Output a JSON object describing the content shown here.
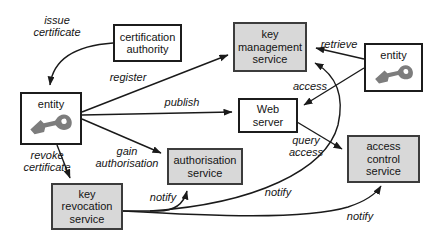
{
  "diagram": {
    "colors": {
      "box_gray": "#d8d8d8",
      "box_white": "#ffffff",
      "box_border": "#3c3c3c",
      "line": "#1a1a1a",
      "key_icon_gray": "#7d7d7d"
    },
    "nodes": [
      {
        "id": "certification-authority",
        "label": "certification\nauthority",
        "fill": "white"
      },
      {
        "id": "key-management-service",
        "label": "key\nmanagement\nservice",
        "fill": "gray"
      },
      {
        "id": "entity-top-right",
        "label": "entity",
        "fill": "white",
        "icon": "key-icon"
      },
      {
        "id": "entity-left",
        "label": "entity",
        "fill": "white",
        "icon": "key-icon"
      },
      {
        "id": "web-server",
        "label": "Web\nserver",
        "fill": "white"
      },
      {
        "id": "authorisation-service",
        "label": "authorisation\nservice",
        "fill": "gray"
      },
      {
        "id": "access-control-service",
        "label": "access\ncontrol\nservice",
        "fill": "gray"
      },
      {
        "id": "key-revocation-service",
        "label": "key\nrevocation\nservice",
        "fill": "gray"
      }
    ],
    "edge_labels": [
      {
        "id": "issue-certificate",
        "text": "issue\ncertificate"
      },
      {
        "id": "register",
        "text": "register"
      },
      {
        "id": "retrieve",
        "text": "retrieve"
      },
      {
        "id": "publish",
        "text": "publish"
      },
      {
        "id": "access",
        "text": "access"
      },
      {
        "id": "gain-authorisation",
        "text": "gain\nauthorisation"
      },
      {
        "id": "query-access",
        "text": "query\naccess"
      },
      {
        "id": "revoke-certificate",
        "text": "revoke\ncertificate"
      },
      {
        "id": "notify-authorisation",
        "text": "notify"
      },
      {
        "id": "notify-key-management",
        "text": "notify"
      },
      {
        "id": "notify-access-control",
        "text": "notify"
      }
    ],
    "edges": [
      {
        "from": "certification-authority",
        "to": "entity-left",
        "label": "issue certificate"
      },
      {
        "from": "entity-left",
        "to": "key-management-service",
        "label": "register"
      },
      {
        "from": "entity-left",
        "to": "web-server",
        "label": "publish"
      },
      {
        "from": "entity-left",
        "to": "authorisation-service",
        "label": "gain authorisation"
      },
      {
        "from": "entity-left",
        "to": "key-revocation-service",
        "label": "revoke certificate"
      },
      {
        "from": "entity-top-right",
        "to": "key-management-service",
        "label": "retrieve"
      },
      {
        "from": "entity-top-right",
        "to": "web-server",
        "label": "access"
      },
      {
        "from": "web-server",
        "to": "access-control-service",
        "label": "query access"
      },
      {
        "from": "key-revocation-service",
        "to": "authorisation-service",
        "label": "notify"
      },
      {
        "from": "key-revocation-service",
        "to": "key-management-service",
        "label": "notify"
      },
      {
        "from": "key-revocation-service",
        "to": "access-control-service",
        "label": "notify"
      }
    ]
  }
}
